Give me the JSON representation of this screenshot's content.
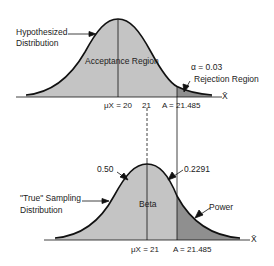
{
  "top": {
    "label_distribution": [
      "Hypothesized",
      "Distribution"
    ],
    "region_label": "Acceptance Region",
    "alpha_label": "α = 0.03",
    "rejection_label": "Rejection Region",
    "mean_label": "μX = 20",
    "tick_21": "21",
    "critical_label": "A = 21.485",
    "axis_label": "X̄"
  },
  "bottom": {
    "label_distribution": [
      "\"True\" Sampling",
      "Distribution"
    ],
    "left_annotation": "0.50",
    "right_annotation": "0.2291",
    "region_label": "Beta",
    "power_label": "Power",
    "mean_label": "μX = 21",
    "critical_label": "A = 21.485",
    "axis_label": "X̄"
  },
  "colors": {
    "fill_light": "#c4c4c4",
    "fill_dark": "#8f8f8f",
    "stroke": "#111111"
  }
}
